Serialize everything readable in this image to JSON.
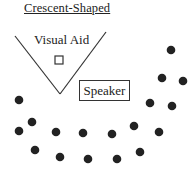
{
  "title": "Crescent-Shaped",
  "labels": {
    "visual_aid": "Visual Aid",
    "speaker": "Speaker"
  },
  "colors": {
    "ink": "#222222",
    "background": "#ffffff"
  },
  "shapes": {
    "v_lines": [
      [
        15,
        36,
        60,
        94
      ],
      [
        106,
        32,
        60,
        94
      ]
    ],
    "visual_aid_square": {
      "x": 55,
      "y": 56,
      "w": 8,
      "h": 8
    }
  },
  "audience_seats": [
    {
      "x": 171,
      "y": 50
    },
    {
      "x": 162,
      "y": 78
    },
    {
      "x": 183,
      "y": 81
    },
    {
      "x": 150,
      "y": 103
    },
    {
      "x": 172,
      "y": 106
    },
    {
      "x": 19,
      "y": 100
    },
    {
      "x": 32,
      "y": 122
    },
    {
      "x": 19,
      "y": 131
    },
    {
      "x": 56,
      "y": 132
    },
    {
      "x": 83,
      "y": 133
    },
    {
      "x": 112,
      "y": 134
    },
    {
      "x": 134,
      "y": 126
    },
    {
      "x": 159,
      "y": 132
    },
    {
      "x": 35,
      "y": 150
    },
    {
      "x": 60,
      "y": 157
    },
    {
      "x": 88,
      "y": 159
    },
    {
      "x": 117,
      "y": 159
    },
    {
      "x": 140,
      "y": 152
    }
  ]
}
